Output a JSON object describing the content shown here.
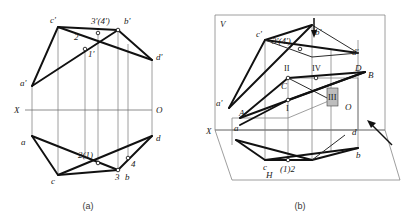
{
  "figure": {
    "captions": {
      "left": "(a)",
      "right": "(b)"
    }
  },
  "left_diagram": {
    "name": "orthographic-projection",
    "axis": {
      "left_label": "X",
      "right_label": "O"
    },
    "labels": {
      "a_prime": "a'",
      "b_prime": "b'",
      "c_prime": "c'",
      "d_prime": "d'",
      "a": "a",
      "b": "b",
      "c": "c",
      "d": "d",
      "p1_prime": "1'",
      "p2_prime": "2'",
      "p34_prime": "3'(4')",
      "p21": "2(1)",
      "p3": "3",
      "p4": "4"
    }
  },
  "right_diagram": {
    "name": "pictorial-projection",
    "planes": {
      "vertical": "V",
      "horizontal": "H"
    },
    "axis": {
      "left_label": "X",
      "origin_label": "O"
    },
    "labels": {
      "a_prime": "a'",
      "b_prime": "b'",
      "c_prime": "c'",
      "d_prime": "d'",
      "a": "a",
      "b": "b",
      "c": "c",
      "d": "d",
      "A": "A",
      "B": "B",
      "C": "C",
      "D": "D",
      "p34_prime": "3'(4')",
      "p12": "(1)2",
      "rom1": "I",
      "rom2": "II",
      "rom3": "III",
      "rom4": "IV"
    },
    "arrows": {
      "top": "down-arrow",
      "right": "up-left-arrow"
    }
  }
}
